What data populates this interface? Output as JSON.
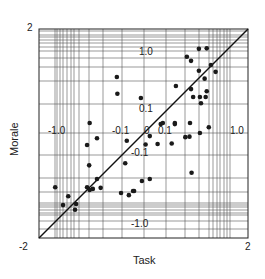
{
  "chart_data": {
    "type": "scatter",
    "title": "",
    "xlabel": "Task",
    "ylabel": "Morale",
    "xlim": [
      -2,
      2
    ],
    "ylim": [
      -2,
      2
    ],
    "corner_ticks": {
      "x_min": "-2",
      "x_max": "2",
      "y_max": "2",
      "y_min": "-2"
    },
    "inner_labels": {
      "x_axis": [
        "-1.0",
        "-0.1",
        "0",
        "0.1",
        "1.0"
      ],
      "y_axis": [
        "1.0",
        "0.1",
        "-0.1",
        "-1.0"
      ]
    },
    "grid": "log-symmetric",
    "reference_line": {
      "from": [
        -2,
        -2
      ],
      "to": [
        2,
        2
      ]
    },
    "points": [
      [
        1.06,
        1.62
      ],
      [
        1.21,
        1.63
      ],
      [
        0.83,
        1.47
      ],
      [
        0.91,
        1.39
      ],
      [
        1.29,
        1.31
      ],
      [
        1.38,
        1.18
      ],
      [
        1.06,
        1.2
      ],
      [
        1.17,
        1.05
      ],
      [
        0.62,
        0.91
      ],
      [
        0.91,
        0.85
      ],
      [
        1.21,
        0.81
      ],
      [
        0.95,
        0.7
      ],
      [
        1.08,
        0.7
      ],
      [
        1.19,
        0.7
      ],
      [
        1.1,
        0.58
      ],
      [
        0.6,
        0.18
      ],
      [
        0.89,
        0.2
      ],
      [
        1.25,
        0.12
      ],
      [
        1.08,
        0.01
      ],
      [
        0.8,
        -0.07
      ],
      [
        -0.51,
        1.08
      ],
      [
        -0.5,
        0.76
      ],
      [
        -0.05,
        0.68
      ],
      [
        0.33,
        0.18
      ],
      [
        0.37,
        0.2
      ],
      [
        0.6,
        0.2
      ],
      [
        0.88,
        -0.06
      ],
      [
        0.54,
        -0.19
      ],
      [
        0.12,
        -0.05
      ],
      [
        0.04,
        -0.21
      ],
      [
        0.27,
        -0.2
      ],
      [
        -1.03,
        0.2
      ],
      [
        -0.89,
        -0.09
      ],
      [
        -1.08,
        -0.22
      ],
      [
        -0.32,
        -0.14
      ],
      [
        -1.04,
        -0.61
      ],
      [
        -0.35,
        -0.57
      ],
      [
        -0.89,
        -0.87
      ],
      [
        -1.69,
        -1.03
      ],
      [
        -1.08,
        -1.03
      ],
      [
        -1.03,
        -1.08
      ],
      [
        -0.97,
        -1.06
      ],
      [
        -0.82,
        -1.04
      ],
      [
        -0.43,
        -1.14
      ],
      [
        -0.28,
        -1.18
      ],
      [
        -0.18,
        -1.1
      ],
      [
        -1.44,
        -1.2
      ],
      [
        -1.54,
        -1.37
      ],
      [
        -1.29,
        -1.35
      ],
      [
        -1.31,
        -1.46
      ],
      [
        0.92,
        -0.75
      ],
      [
        0.12,
        -0.87
      ],
      [
        -0.03,
        -0.91
      ],
      [
        -0.2,
        -1.1
      ]
    ]
  }
}
